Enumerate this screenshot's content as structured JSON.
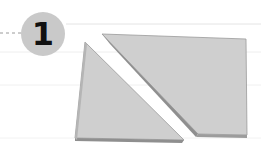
{
  "step": {
    "number": "1",
    "badge_color": "#c9c9c9",
    "number_color": "#111111"
  },
  "shapes": {
    "piece_color": "#cfcfcf",
    "edge_color": "#8a8a8a",
    "items": [
      {
        "name": "left-triangle-piece"
      },
      {
        "name": "right-trapezoid-piece"
      }
    ]
  }
}
